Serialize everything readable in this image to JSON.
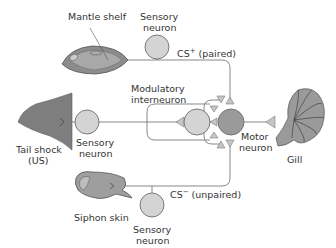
{
  "diagram": {
    "type": "neural-circuit",
    "colors": {
      "background": "#ffffff",
      "wire": "#7a7a7a",
      "sensory_neuron_fill": "#d4d4d4",
      "motor_neuron_fill": "#9a9a9a",
      "synapse_fill": "#c6c6c6",
      "text": "#333333"
    },
    "organs": {
      "mantle_shelf": "Mantle shelf",
      "tail_shock_line1": "Tail shock",
      "tail_shock_line2": "(US)",
      "siphon_skin": "Siphon skin",
      "gill": "Gill"
    },
    "neurons": {
      "sensory_top_line1": "Sensory",
      "sensory_top_line2": "neuron",
      "sensory_mid_line1": "Sensory",
      "sensory_mid_line2": "neuron",
      "sensory_bottom_line1": "Sensory",
      "sensory_bottom_line2": "neuron",
      "modulatory_line1": "Modulatory",
      "modulatory_line2": "interneuron",
      "motor_line1": "Motor",
      "motor_line2": "neuron"
    },
    "pathways": {
      "cs_plus_base": "CS",
      "cs_plus_sup": "+",
      "cs_plus_note": " (paired)",
      "cs_minus_base": "CS",
      "cs_minus_sup": "−",
      "cs_minus_note": " (unpaired)"
    }
  }
}
